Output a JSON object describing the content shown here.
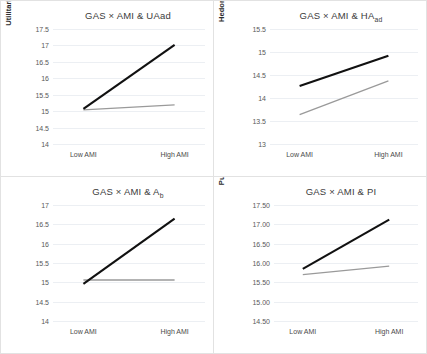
{
  "figure": {
    "panel_count": 4,
    "xlabels": [
      "Low AMI",
      "High AMI"
    ],
    "series_colors": {
      "high_gas": "#111111",
      "low_gas": "#9a9a9a"
    }
  },
  "chart_data": [
    {
      "id": "panel-uaad",
      "type": "line",
      "title": "GAS × AMI & UAad",
      "title_main": "GAS × AMI & UAad",
      "xlabel": "",
      "ylabel": "Utilitarian Dimension of Aad",
      "categories": [
        "Low AMI",
        "High AMI"
      ],
      "ylim": [
        14,
        17.5
      ],
      "yticks": [
        "17.5",
        "17",
        "16.5",
        "16",
        "15.5",
        "15",
        "14.5",
        "14"
      ],
      "ytick_values": [
        17.5,
        17,
        16.5,
        16,
        15.5,
        15,
        14.5,
        14
      ],
      "grid": true,
      "legend": "none",
      "series": [
        {
          "name": "High GAS",
          "color": "#111111",
          "values": [
            15.07,
            17.02
          ]
        },
        {
          "name": "Low GAS",
          "color": "#9a9a9a",
          "values": [
            15.04,
            15.19
          ]
        }
      ]
    },
    {
      "id": "panel-haad",
      "type": "line",
      "title": "GAS × AMI & HAad",
      "title_main": "GAS × AMI & HA",
      "title_sub": "ad",
      "xlabel": "",
      "ylabel": "Hedonic Dimension of Aad",
      "ylabel_main": "Hedonic Dimension of A",
      "ylabel_sub": "ad",
      "categories": [
        "Low AMI",
        "High AMI"
      ],
      "ylim": [
        13,
        15.5
      ],
      "yticks": [
        "15.5",
        "15",
        "14.5",
        "14",
        "13.5",
        "13"
      ],
      "ytick_values": [
        15.5,
        15,
        14.5,
        14,
        13.5,
        13
      ],
      "grid": true,
      "legend": "none",
      "series": [
        {
          "name": "High GAS",
          "color": "#111111",
          "values": [
            14.26,
            14.92
          ]
        },
        {
          "name": "Low GAS",
          "color": "#9a9a9a",
          "values": [
            13.64,
            14.37
          ]
        }
      ]
    },
    {
      "id": "panel-ab",
      "type": "line",
      "title": "GAS × AMI & Ab",
      "title_main": "GAS × AMI & A",
      "title_sub": "b",
      "xlabel": "",
      "ylabel": "Brand Attitude",
      "categories": [
        "Low AMI",
        "High AMI"
      ],
      "ylim": [
        14,
        17
      ],
      "yticks": [
        "17",
        "16.5",
        "16",
        "15.5",
        "15",
        "14.5",
        "14"
      ],
      "ytick_values": [
        17,
        16.5,
        16,
        15.5,
        15,
        14.5,
        14
      ],
      "grid": true,
      "legend": "none",
      "series": [
        {
          "name": "High GAS",
          "color": "#111111",
          "values": [
            14.96,
            16.65
          ]
        },
        {
          "name": "Low GAS",
          "color": "#9a9a9a",
          "values": [
            15.06,
            15.06
          ]
        }
      ]
    },
    {
      "id": "panel-pi",
      "type": "line",
      "title": "GAS × AMI & PI",
      "title_main": "GAS × AMI & PI",
      "xlabel": "",
      "ylabel": "Purchase Intention",
      "categories": [
        "Low AMI",
        "High AMI"
      ],
      "ylim": [
        14.5,
        17.5
      ],
      "yticks": [
        "17.50",
        "17.00",
        "16.50",
        "16.00",
        "15.50",
        "15.00",
        "14.50"
      ],
      "ytick_values": [
        17.5,
        17.0,
        16.5,
        16.0,
        15.5,
        15.0,
        14.5
      ],
      "grid": true,
      "legend": "none",
      "series": [
        {
          "name": "High GAS",
          "color": "#111111",
          "values": [
            15.85,
            17.12
          ]
        },
        {
          "name": "Low GAS",
          "color": "#9a9a9a",
          "values": [
            15.7,
            15.92
          ]
        }
      ]
    }
  ]
}
